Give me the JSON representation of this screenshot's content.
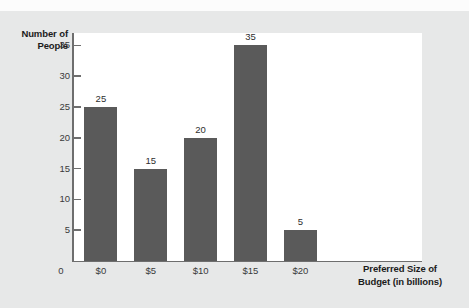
{
  "chart_data": {
    "type": "bar",
    "title": "",
    "categories": [
      "$0",
      "$5",
      "$10",
      "$15",
      "$20"
    ],
    "values": [
      25,
      15,
      20,
      35,
      5
    ],
    "value_labels": [
      "25",
      "15",
      "20",
      "35",
      "5"
    ],
    "xlabel": "Preferred Size of Budget (in billions)",
    "xlabel_line1": "Preferred Size of",
    "xlabel_line2": "Budget (in billions)",
    "ylabel": "Number of People",
    "ylabel_line1": "Number of",
    "ylabel_line2": "People",
    "ylim": [
      0,
      37
    ],
    "yticks": [
      0,
      5,
      10,
      15,
      20,
      25,
      30,
      35
    ],
    "ytick_labels": [
      "0",
      "5",
      "10",
      "15",
      "20",
      "25",
      "30",
      "35"
    ],
    "grid": false,
    "legend": "none",
    "bar_color": "#5a5a5a",
    "axis_color": "#6e6e6e",
    "plot_background": "#ffffff",
    "page_background": "#e7e8e8"
  }
}
